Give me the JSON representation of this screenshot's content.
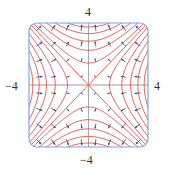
{
  "chart_data": {
    "type": "vector_field_with_contours",
    "title": "",
    "function": "f(x,y) = y^2 - x^2",
    "gradient_field": "(-2x, 2y)",
    "xlim": [
      -4,
      4
    ],
    "ylim": [
      -4,
      4
    ],
    "tick_labels": {
      "top": "4",
      "bottom": "−4",
      "left": "−4",
      "right": "4"
    },
    "contour_levels": [
      -14,
      -11,
      -8,
      -5,
      -2,
      0,
      2,
      5,
      8,
      11,
      14
    ],
    "vector_grid": [
      -3.5,
      -2.5,
      -1.5,
      -0.5,
      0.5,
      1.5,
      2.5,
      3.5
    ],
    "colors": {
      "frame": "#7fa8d8",
      "contour": "#d9534a",
      "vector": "#3b4f8c",
      "axis_vertical": "#a8a8a8",
      "axis_horizontal": "#c98a80"
    }
  },
  "labels": {
    "top": "4",
    "bottom": "−4",
    "left": "−4",
    "right": "4"
  }
}
